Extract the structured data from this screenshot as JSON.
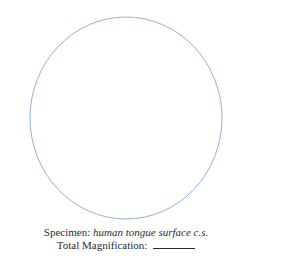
{
  "drawing_field": {
    "shape": "circle",
    "stroke_color": "#8fb4dc"
  },
  "caption": {
    "specimen_label": "Specimen: ",
    "specimen_value": "human tongue surface c.s.",
    "magnification_label": "Total Magnification: ",
    "magnification_value": ""
  }
}
